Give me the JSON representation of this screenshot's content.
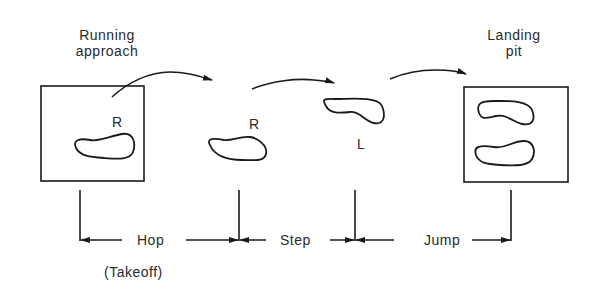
{
  "title_labels": {
    "running_approach_line1": "Running",
    "running_approach_line2": "approach",
    "landing_pit_line1": "Landing",
    "landing_pit_line2": "pit"
  },
  "foot_labels": {
    "takeoff_foot": "R",
    "hop_foot": "R",
    "step_foot": "L"
  },
  "phases": {
    "hop": "Hop",
    "step": "Step",
    "jump": "Jump",
    "takeoff": "(Takeoff)"
  },
  "colors": {
    "ink": "#1a1a1a",
    "background": "#ffffff"
  }
}
